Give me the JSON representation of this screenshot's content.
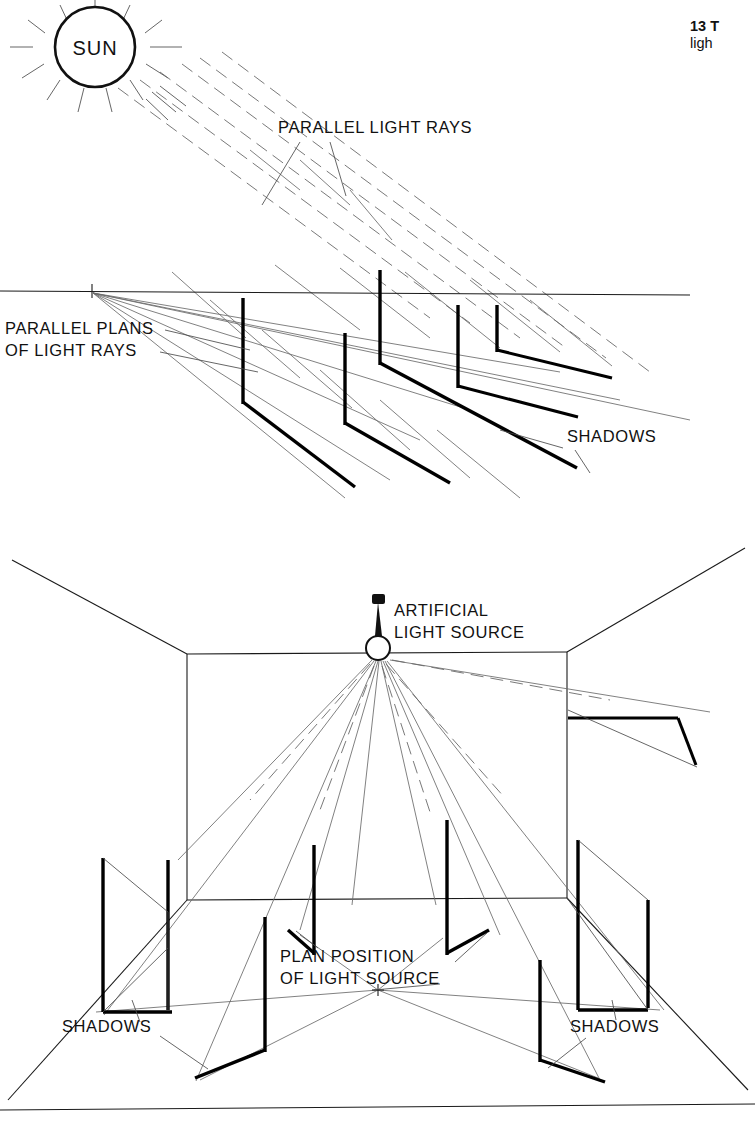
{
  "page": {
    "number": "13",
    "header_line1": "13 T",
    "header_line2": "ligh"
  },
  "diagram_top": {
    "name": "sunlight-shadows",
    "sun_label": "SUN",
    "labels": {
      "parallel_light_rays": "PARALLEL LIGHT RAYS",
      "parallel_plans_line1": "PARALLEL PLANS",
      "parallel_plans_line2": "OF LIGHT RAYS",
      "shadows": "SHADOWS"
    },
    "poles_count": 5,
    "ray_type": "parallel"
  },
  "diagram_bottom": {
    "name": "artificial-light-shadows",
    "labels": {
      "artificial_line1": "ARTIFICIAL",
      "artificial_line2": "LIGHT SOURCE",
      "plan_position_line1": "PLAN POSITION",
      "plan_position_line2": "OF LIGHT SOURCE",
      "shadows_left": "SHADOWS",
      "shadows_right": "SHADOWS"
    },
    "poles_count": 6,
    "ray_type": "radial"
  },
  "colors": {
    "ink": "#111111",
    "hairline": "#6a6a6a",
    "paper": "#ffffff"
  }
}
